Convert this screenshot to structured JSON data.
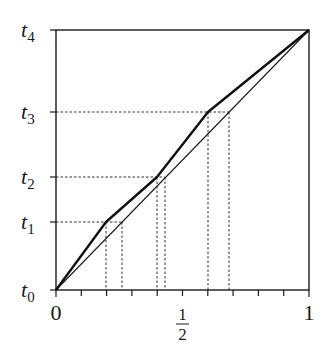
{
  "diagram": {
    "type": "piecewise-linear mapping plot",
    "frame": {
      "x0": 56,
      "x1": 309,
      "y0": 290,
      "y1": 30
    },
    "y_labels": [
      {
        "base": "t",
        "sub": "0",
        "value": 0
      },
      {
        "base": "t",
        "sub": "1",
        "value": 0.262
      },
      {
        "base": "t",
        "sub": "2",
        "value": 0.435
      },
      {
        "base": "t",
        "sub": "3",
        "value": 0.685
      },
      {
        "base": "t",
        "sub": "4",
        "value": 1
      }
    ],
    "x_labels": {
      "zero": "0",
      "half_num": "1",
      "half_den": "2",
      "one": "1"
    },
    "x_ticks": [
      0,
      0.1,
      0.2,
      0.3,
      0.4,
      0.5,
      0.6,
      0.7,
      0.8,
      0.9,
      1.0
    ],
    "thick_curve_points": [
      [
        0,
        0
      ],
      [
        0.2,
        0.262
      ],
      [
        0.4,
        0.435
      ],
      [
        0.6,
        0.685
      ],
      [
        1,
        1
      ]
    ],
    "thin_diagonal": [
      [
        0,
        0
      ],
      [
        1,
        1
      ]
    ],
    "dashed_guides": [
      {
        "level": 0.262,
        "x_thick": 0.2,
        "x_thin": 0.262
      },
      {
        "level": 0.435,
        "x_thick": 0.4,
        "x_thin": 0.435
      },
      {
        "level": 0.685,
        "x_thick": 0.6,
        "x_thin": 0.685
      }
    ],
    "colors": {
      "line": "#1a1a1a",
      "dash": "#333333",
      "background": "#ffffff"
    }
  }
}
